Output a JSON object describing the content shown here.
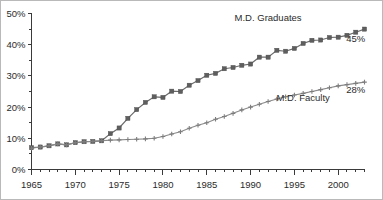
{
  "chart_data": {
    "type": "line",
    "title": "",
    "subtitle": "",
    "xlabel": "",
    "ylabel": "",
    "xlim": [
      1965,
      2003
    ],
    "ylim": [
      0,
      50
    ],
    "grid": false,
    "legend_position": "inline-annotations",
    "y_ticks_major": [
      "0%",
      "10%",
      "20%",
      "30%",
      "40%",
      "50%"
    ],
    "y_tick_values_major": [
      0,
      10,
      20,
      30,
      40,
      50
    ],
    "y_tick_values_minor": [
      5,
      15,
      25,
      35,
      45
    ],
    "x_ticks_major": [
      "1965",
      "1970",
      "1975",
      "1980",
      "1985",
      "1990",
      "1995",
      "2000"
    ],
    "x_tick_values_major": [
      1965,
      1970,
      1975,
      1980,
      1985,
      1990,
      1995,
      2000
    ],
    "x": [
      1965,
      1966,
      1967,
      1968,
      1969,
      1970,
      1971,
      1972,
      1973,
      1974,
      1975,
      1976,
      1977,
      1978,
      1979,
      1980,
      1981,
      1982,
      1983,
      1984,
      1985,
      1986,
      1987,
      1988,
      1989,
      1990,
      1991,
      1992,
      1993,
      1994,
      1995,
      1996,
      1997,
      1998,
      1999,
      2000,
      2001,
      2002,
      2003
    ],
    "series": [
      {
        "name": "M.D. Graduates",
        "marker": "square",
        "color": "#5e5e5e",
        "end_label": "45%",
        "values": [
          7.0,
          7.2,
          7.6,
          8.2,
          7.9,
          8.6,
          8.9,
          9.0,
          9.2,
          11.5,
          13.3,
          16.4,
          19.2,
          21.5,
          23.3,
          23.1,
          25.1,
          25.0,
          27.0,
          28.5,
          30.2,
          30.8,
          32.3,
          32.7,
          33.4,
          33.8,
          36.0,
          36.0,
          38.2,
          37.9,
          38.8,
          40.4,
          41.4,
          41.5,
          42.3,
          42.4,
          43.0,
          44.0,
          45.0
        ]
      },
      {
        "name": "M.D. Faculty",
        "marker": "plus",
        "color": "#7d7d7d",
        "end_label": "28%",
        "values": [
          6.8,
          7.2,
          7.6,
          8.2,
          7.9,
          8.6,
          8.9,
          9.0,
          9.2,
          9.4,
          9.5,
          9.6,
          9.7,
          9.8,
          10.0,
          10.6,
          11.4,
          12.1,
          13.2,
          14.2,
          15.0,
          16.1,
          17.0,
          18.0,
          19.1,
          20.0,
          20.9,
          21.8,
          22.6,
          23.3,
          23.9,
          24.4,
          25.0,
          25.6,
          26.2,
          26.8,
          27.2,
          27.6,
          28.0
        ]
      }
    ],
    "annotations": [
      {
        "text": "M.D. Graduates",
        "x": 1992,
        "y": 47.5
      },
      {
        "text": "45%",
        "x": 2002,
        "y": 41.0
      },
      {
        "text": "M.D. Faculty",
        "x": 1996,
        "y": 22.0
      },
      {
        "text": "28%",
        "x": 2002,
        "y": 24.5
      }
    ]
  },
  "colors": {
    "background": "#ffffff",
    "border": "#b9b9b9",
    "axis": "#3a3a3a",
    "graduates": "#5e5e5e",
    "faculty": "#7d7d7d",
    "text": "#2b2b2b"
  }
}
